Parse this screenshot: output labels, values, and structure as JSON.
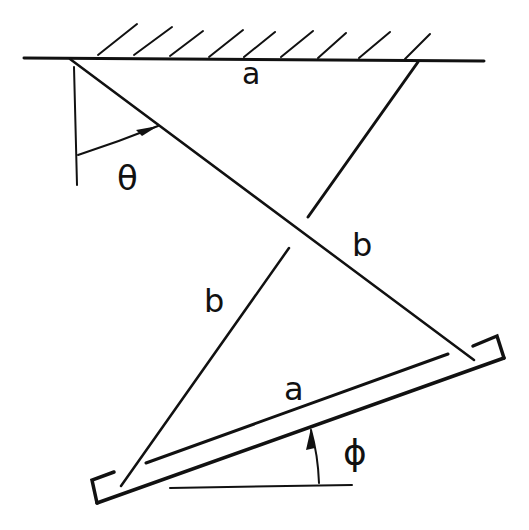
{
  "diagram": {
    "type": "mechanism-linkage",
    "labels": {
      "top_link": "a",
      "bottom_link": "a",
      "right_bar": "b",
      "left_bar": "b",
      "angle_theta": "θ",
      "angle_phi": "ϕ"
    },
    "ceiling": {
      "line": [
        [
          24,
          58
        ],
        [
          484,
          61
        ]
      ],
      "hatch_bases_x": [
        98,
        134,
        170,
        210,
        245,
        282,
        318,
        360,
        405
      ]
    },
    "bars": {
      "diagonal_b_from_left_pivot": [
        [
          70,
          59
        ],
        [
          474,
          360
        ]
      ],
      "right_bar_upper_segment": [
        [
          418,
          61
        ],
        [
          308,
          217
        ]
      ],
      "left_bar_lower_segment": [
        [
          289,
          248
        ],
        [
          121,
          486
        ]
      ]
    },
    "plate": {
      "outer_edge": [
        [
          97,
          503
        ],
        [
          504,
          358
        ]
      ],
      "inner_edge": [
        [
          146,
          463
        ],
        [
          448,
          354
        ]
      ],
      "left_bracket": [
        [
          114,
          472
        ],
        [
          92,
          480
        ],
        [
          97,
          503
        ]
      ],
      "right_bracket": [
        [
          473,
          345
        ],
        [
          497,
          336
        ],
        [
          504,
          358
        ]
      ]
    },
    "references": {
      "vertical": [
        [
          74,
          67
        ],
        [
          77,
          185
        ]
      ],
      "horizontal": [
        [
          170,
          488
        ],
        [
          352,
          485
        ]
      ]
    },
    "colors": {
      "ink": "#111111",
      "background": "#ffffff"
    }
  }
}
